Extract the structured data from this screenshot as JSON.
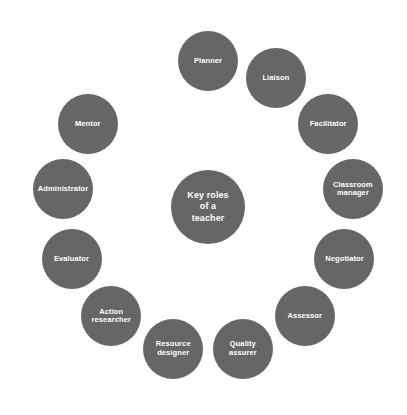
{
  "diagram": {
    "title": "Key roles of a teacher",
    "type": "circular-cycle-diagram",
    "colors": {
      "background": "#ffffff",
      "node_fill": "#666666",
      "node_text": "#ffffff",
      "connector": "#d9d9d9"
    },
    "center": {
      "label": "Key roles\nof a\nteacher",
      "line1": "Key roles",
      "line2": "of a",
      "line3": "teacher"
    },
    "nodes": [
      {
        "id": "planner",
        "label": "Planner",
        "angle_deg": 0
      },
      {
        "id": "liaison",
        "label": "Liaison",
        "angle_deg": 27.7
      },
      {
        "id": "facilitator",
        "label": "Facilitator",
        "angle_deg": 55.4
      },
      {
        "id": "classroom-manager",
        "label": "Classroom\nmanager",
        "angle_deg": 83.1
      },
      {
        "id": "negotiator",
        "label": "Negotiator",
        "angle_deg": 110.8
      },
      {
        "id": "assessor",
        "label": "Assessor",
        "angle_deg": 138.5
      },
      {
        "id": "quality-assurer",
        "label": "Quality\nassurer",
        "angle_deg": 166.2
      },
      {
        "id": "resource-designer",
        "label": "Resource\ndesigner",
        "angle_deg": 193.8
      },
      {
        "id": "action-researcher",
        "label": "Action\nresearcher",
        "angle_deg": 221.5
      },
      {
        "id": "evaluator",
        "label": "Evaluator",
        "angle_deg": 249.2
      },
      {
        "id": "administrator",
        "label": "Administrator",
        "angle_deg": 276.9
      },
      {
        "id": "mentor",
        "label": "Mentor",
        "angle_deg": 304.6
      },
      {
        "id": "planner-gap",
        "label": "",
        "angle_deg": 332.3
      }
    ],
    "geometry": {
      "center_x": 208,
      "center_y": 207,
      "ring_radius": 146,
      "node_diameter": 60,
      "center_diameter": 74,
      "connector_width": 7
    }
  }
}
